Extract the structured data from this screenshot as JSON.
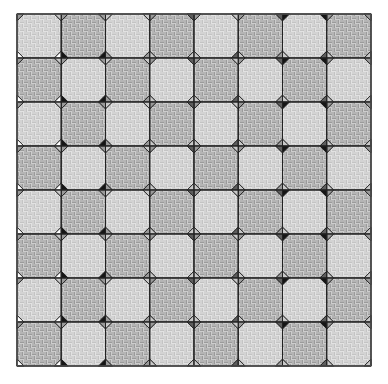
{
  "board": {
    "origin_x": 17,
    "origin_y": 14,
    "width": 354,
    "height": 352,
    "cols": 8,
    "rows": 8,
    "octagon_inset_ratio": 0.5,
    "colors": {
      "background": "#ffffff",
      "grid_line": "#222222",
      "octagon_light": "#e2e2e2",
      "octagon_light_weave": "#b8b8b8",
      "octagon_medium": "#c8c8c8",
      "octagon_medium_weave": "#8e8e8e",
      "shade": {
        "white": "#ffffff",
        "light": "#c9c9c9",
        "mid": "#9a9a9a",
        "dark": "#5e5e5e",
        "black": "#161616"
      }
    },
    "octagon_pattern": "checkerboard",
    "octagon_first": "light",
    "column_diamonds": [
      {
        "line": 0,
        "nw": "light",
        "ne": "white",
        "sw": "mid",
        "se": "mid"
      },
      {
        "line": 1,
        "nw": "white",
        "ne": "black",
        "sw": "light",
        "se": "mid"
      },
      {
        "line": 2,
        "nw": "black",
        "ne": "mid",
        "sw": "mid",
        "se": "light"
      },
      {
        "line": 3,
        "nw": "mid",
        "ne": "light",
        "sw": "light",
        "se": "mid"
      },
      {
        "line": 4,
        "nw": "light",
        "ne": "light",
        "sw": "dark",
        "se": "mid"
      },
      {
        "line": 5,
        "nw": "dark",
        "ne": "light",
        "sw": "light",
        "se": "mid"
      },
      {
        "line": 6,
        "nw": "mid",
        "ne": "light",
        "sw": "dark",
        "se": "black"
      },
      {
        "line": 7,
        "nw": "dark",
        "ne": "light",
        "sw": "black",
        "se": "mid"
      },
      {
        "line": 8,
        "nw": "light",
        "ne": "light",
        "sw": "mid",
        "se": "mid"
      }
    ]
  }
}
